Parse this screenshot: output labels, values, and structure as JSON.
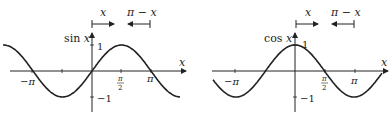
{
  "figures": [
    {
      "id": "sine",
      "ylabel": "sin x",
      "ylabel_fn": "sin",
      "xlabel": "x",
      "ticks_x": [
        "−π",
        "π/2",
        "π"
      ],
      "ticks_y": [
        "1",
        "−1"
      ],
      "arrow_left_label": "x",
      "arrow_right_label": "π − x"
    },
    {
      "id": "cosine",
      "ylabel": "cos x",
      "ylabel_fn": "cos",
      "xlabel": "x",
      "ticks_x": [
        "−π",
        "π/2",
        "π"
      ],
      "ticks_y": [
        "1",
        "−1"
      ],
      "arrow_left_label": "x",
      "arrow_right_label": "π − x"
    }
  ],
  "chart_data": [
    {
      "type": "line",
      "title": "",
      "xlabel": "x",
      "ylabel": "sin x",
      "series": [
        {
          "name": "sin x",
          "function": "sin(x)"
        }
      ],
      "xlim": [
        -4.2,
        4.8
      ],
      "ylim": [
        -1.2,
        1.2
      ],
      "x_ticks": [
        "−π",
        "π/2",
        "π"
      ],
      "y_ticks": [
        "1",
        "−1"
      ],
      "annotations": [
        "x (arrow right from 0)",
        "π − x (arrow left to π)"
      ],
      "grid": false
    },
    {
      "type": "line",
      "title": "",
      "xlabel": "x",
      "ylabel": "cos x",
      "series": [
        {
          "name": "cos x",
          "function": "cos(x)"
        }
      ],
      "xlim": [
        -4.2,
        4.8
      ],
      "ylim": [
        -1.2,
        1.2
      ],
      "x_ticks": [
        "−π",
        "π/2",
        "π"
      ],
      "y_ticks": [
        "1",
        "−1"
      ],
      "annotations": [
        "x (arrow right from 0)",
        "π − x (arrow left to π)"
      ],
      "grid": false
    }
  ]
}
